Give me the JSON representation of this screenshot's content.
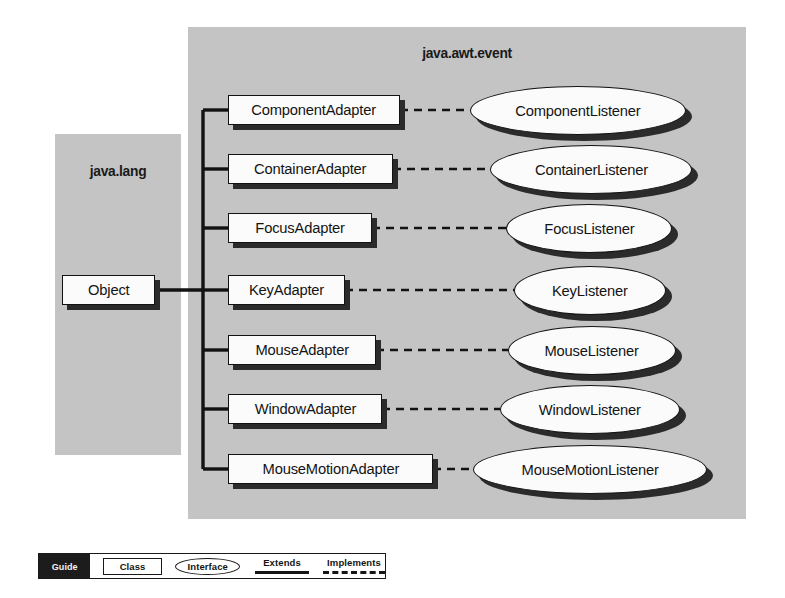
{
  "diagram": {
    "packages": [
      {
        "id": "java-lang",
        "name": "java.lang"
      },
      {
        "id": "java-awt-event",
        "name": "java.awt.event"
      }
    ],
    "root_class": {
      "name": "Object",
      "package": "java.lang"
    },
    "rows": [
      {
        "adapter": "ComponentAdapter",
        "listener": "ComponentListener"
      },
      {
        "adapter": "ContainerAdapter",
        "listener": "ContainerListener"
      },
      {
        "adapter": "FocusAdapter",
        "listener": "FocusListener"
      },
      {
        "adapter": "KeyAdapter",
        "listener": "KeyListener"
      },
      {
        "adapter": "MouseAdapter",
        "listener": "MouseListener"
      },
      {
        "adapter": "WindowAdapter",
        "listener": "WindowListener"
      },
      {
        "adapter": "MouseMotionAdapter",
        "listener": "MouseMotionListener"
      }
    ],
    "relationships": {
      "extends_label": "Extends",
      "implements_label": "Implements",
      "extends_style": "solid",
      "implements_style": "dashed"
    }
  },
  "legend": {
    "guide_label": "Guide",
    "class_label": "Class",
    "interface_label": "Interface",
    "extends_label": "Extends",
    "implements_label": "Implements"
  },
  "colors": {
    "panel_fill": "#c4c4c4",
    "node_fill": "#fbfbfb",
    "stroke": "#121212",
    "shadow": "#2b2b2b",
    "legend_guide_bg": "#1c1c1c",
    "page_bg": "#ffffff"
  }
}
